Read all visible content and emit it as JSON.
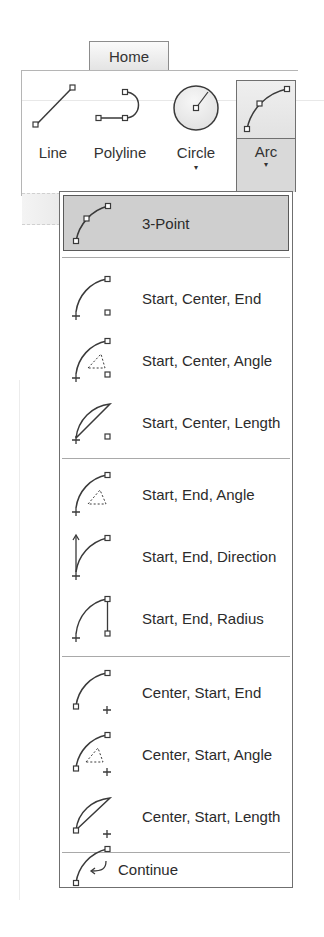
{
  "ribbon": {
    "tab": "Home",
    "tools": [
      {
        "name": "line",
        "label": "Line",
        "icon": "line-icon",
        "has_dropdown": false
      },
      {
        "name": "polyline",
        "label": "Polyline",
        "icon": "polyline-icon",
        "has_dropdown": false
      },
      {
        "name": "circle",
        "label": "Circle",
        "icon": "circle-icon",
        "has_dropdown": true
      },
      {
        "name": "arc",
        "label": "Arc",
        "icon": "arc-3point-icon",
        "has_dropdown": true,
        "active": true
      }
    ],
    "caret": "▾"
  },
  "arc_menu": {
    "groups": [
      [
        {
          "label": "3-Point",
          "icon": "arc-3point-icon",
          "highlighted": true
        }
      ],
      [
        {
          "label": "Start, Center, End",
          "icon": "arc-start-center-end-icon"
        },
        {
          "label": "Start, Center, Angle",
          "icon": "arc-start-center-angle-icon"
        },
        {
          "label": "Start, Center, Length",
          "icon": "arc-start-center-length-icon"
        }
      ],
      [
        {
          "label": "Start, End, Angle",
          "icon": "arc-start-end-angle-icon"
        },
        {
          "label": "Start, End, Direction",
          "icon": "arc-start-end-direction-icon"
        },
        {
          "label": "Start, End, Radius",
          "icon": "arc-start-end-radius-icon"
        }
      ],
      [
        {
          "label": "Center, Start, End",
          "icon": "arc-center-start-end-icon"
        },
        {
          "label": "Center, Start, Angle",
          "icon": "arc-center-start-angle-icon"
        },
        {
          "label": "Center, Start, Length",
          "icon": "arc-center-start-length-icon"
        }
      ],
      [
        {
          "label": "Continue",
          "icon": "arc-continue-icon"
        }
      ]
    ]
  },
  "colors": {
    "highlight_bg": "#cfcfcf",
    "border": "#6f6f6f",
    "icon_stroke": "#3a3a3a"
  }
}
